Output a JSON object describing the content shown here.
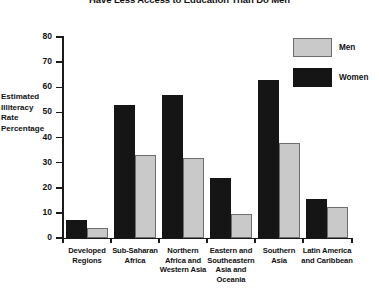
{
  "chart_data": {
    "type": "bar",
    "title": "Have Less Access to Education Than Do Men",
    "xlabel": "",
    "ylabel": "Estimated Illiteracy Rate Percentage",
    "ylim": [
      0,
      80
    ],
    "yticks": [
      0,
      10,
      20,
      30,
      40,
      50,
      60,
      70,
      80
    ],
    "grid": false,
    "legend_position": "top-right",
    "categories": [
      "Developed Regions",
      "Sub-Saharan Africa",
      "Northern Africa and Western Asia",
      "Eastern and Southeastern Asia and Oceania",
      "Southern Asia",
      "Latin America and Caribbean"
    ],
    "series": [
      {
        "name": "Women",
        "color": "#151515",
        "values": [
          7,
          53,
          57,
          24,
          63,
          15.5
        ]
      },
      {
        "name": "Men",
        "color": "#c9c9c9",
        "values": [
          4,
          33,
          32,
          9.5,
          38,
          12.5
        ]
      }
    ]
  },
  "axis": {
    "y_tick_labels": [
      "80",
      "70",
      "60",
      "50",
      "40",
      "30",
      "20",
      "10",
      "0"
    ],
    "y_caption_lines": [
      "Estimated",
      "Illiteracy",
      "Rate",
      "Percentage"
    ]
  },
  "legend": {
    "entries": [
      {
        "label": "Men"
      },
      {
        "label": "Women"
      }
    ]
  },
  "category_labels": [
    {
      "lines": [
        "Developed",
        "Regions"
      ]
    },
    {
      "lines": [
        "Sub-Saharan",
        "Africa"
      ]
    },
    {
      "lines": [
        "Northern",
        "Africa and",
        "Western Asia"
      ]
    },
    {
      "lines": [
        "Eastern and",
        "Southeastern",
        "Asia and",
        "Oceania"
      ]
    },
    {
      "lines": [
        "Southern",
        "Asia"
      ]
    },
    {
      "lines": [
        "Latin America",
        "and Caribbean"
      ]
    }
  ]
}
